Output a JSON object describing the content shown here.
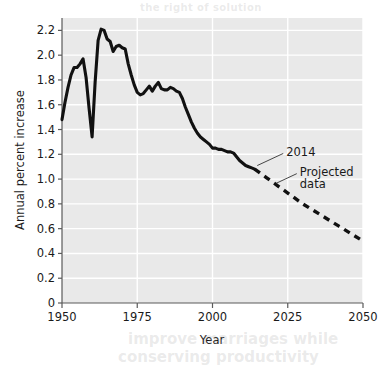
{
  "figure": {
    "background_color": "#ffffff",
    "plot_background_color": "#e9e9e9",
    "gridline_color": "#ffffff",
    "axis_color": "#5a5a5a",
    "line_color": "#111111"
  },
  "ghost_text": {
    "top": "the right of solution",
    "bottom_line1": "improve marriages while",
    "bottom_line2": "conserving productivity"
  },
  "axes": {
    "x": {
      "title": "Year",
      "ticks": [
        "1950",
        "1975",
        "2000",
        "2025",
        "2050"
      ],
      "tick_values": [
        1950,
        1975,
        2000,
        2025,
        2050
      ],
      "min": 1950,
      "max": 2050
    },
    "y": {
      "title": "Annual percent increase",
      "ticks": [
        "0",
        "0.2",
        "0.4",
        "0.6",
        "0.8",
        "1.0",
        "1.2",
        "1.4",
        "1.6",
        "1.8",
        "2.0",
        "2.2"
      ],
      "tick_values": [
        0,
        0.2,
        0.4,
        0.6,
        0.8,
        1.0,
        1.2,
        1.4,
        1.6,
        1.8,
        2.0,
        2.2
      ],
      "min": 0,
      "max": 2.3
    }
  },
  "annotations": [
    {
      "id": "year-2014",
      "label": "2014",
      "text_x": 2024.5,
      "text_y": 1.215,
      "leader_to_x": 2014.2,
      "leader_to_y": 1.085
    },
    {
      "id": "projected-data",
      "label_line1": "Projected",
      "label_line2": "data",
      "text_x": 2029.0,
      "text_y": 1.06,
      "leader_to_x": 2020.5,
      "leader_to_y": 0.95
    }
  ],
  "chart_data": {
    "type": "line",
    "title": "",
    "subtitle": "",
    "xlabel": "Year",
    "ylabel": "Annual percent increase",
    "xlim": [
      1950,
      2050
    ],
    "ylim": [
      0,
      2.3
    ],
    "grid": true,
    "legend_position": "none",
    "series": [
      {
        "name": "Observed data",
        "style": "solid",
        "color": "#111111",
        "x": [
          1950,
          1951,
          1952,
          1953,
          1954,
          1955,
          1956,
          1957,
          1958,
          1959,
          1960,
          1961,
          1962,
          1963,
          1964,
          1965,
          1966,
          1967,
          1968,
          1969,
          1970,
          1971,
          1972,
          1973,
          1974,
          1975,
          1976,
          1977,
          1978,
          1979,
          1980,
          1981,
          1982,
          1983,
          1984,
          1985,
          1986,
          1987,
          1988,
          1989,
          1990,
          1991,
          1992,
          1993,
          1994,
          1995,
          1996,
          1997,
          1998,
          1999,
          2000,
          2001,
          2002,
          2003,
          2004,
          2005,
          2006,
          2007,
          2008,
          2009,
          2010,
          2011,
          2012,
          2013,
          2014
        ],
        "y": [
          1.48,
          1.62,
          1.74,
          1.84,
          1.9,
          1.9,
          1.93,
          1.97,
          1.82,
          1.57,
          1.34,
          1.78,
          2.12,
          2.21,
          2.2,
          2.13,
          2.11,
          2.03,
          2.07,
          2.08,
          2.06,
          2.05,
          1.93,
          1.84,
          1.76,
          1.7,
          1.68,
          1.69,
          1.72,
          1.75,
          1.71,
          1.75,
          1.78,
          1.73,
          1.72,
          1.72,
          1.74,
          1.73,
          1.71,
          1.7,
          1.65,
          1.58,
          1.52,
          1.46,
          1.41,
          1.37,
          1.34,
          1.32,
          1.3,
          1.28,
          1.25,
          1.25,
          1.24,
          1.24,
          1.23,
          1.22,
          1.22,
          1.21,
          1.18,
          1.15,
          1.13,
          1.11,
          1.1,
          1.09,
          1.08
        ]
      },
      {
        "name": "Projected data",
        "style": "dashed",
        "color": "#111111",
        "x": [
          2014,
          2018,
          2022,
          2026,
          2030,
          2034,
          2038,
          2042,
          2046,
          2050
        ],
        "y": [
          1.08,
          1.01,
          0.94,
          0.87,
          0.8,
          0.74,
          0.68,
          0.62,
          0.56,
          0.5
        ]
      }
    ]
  }
}
